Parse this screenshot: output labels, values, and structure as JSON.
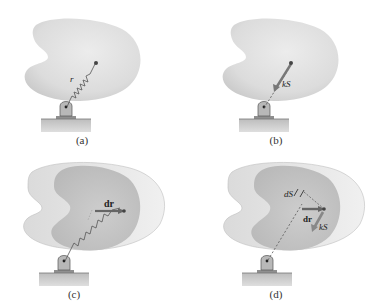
{
  "figure": {
    "panels": [
      {
        "id": "a",
        "caption": "(a)",
        "labels": {
          "position": "r"
        }
      },
      {
        "id": "b",
        "caption": "(b)",
        "labels": {
          "force": "kS"
        }
      },
      {
        "id": "c",
        "caption": "(c)",
        "labels": {
          "displacement": "dr"
        }
      },
      {
        "id": "d",
        "caption": "(d)",
        "labels": {
          "stretch": "dS",
          "displacement": "dr",
          "force": "kS"
        }
      }
    ]
  },
  "colors": {
    "body_light": "#e6e6e6",
    "body_shade": "#cfcfcf",
    "body_displaced_inner": "#c4c4c4",
    "ground": "#c9c9c9",
    "support": "#b5b5b5",
    "spring": "#555555",
    "arrow": "#7a7a7a",
    "point": "#444444"
  }
}
